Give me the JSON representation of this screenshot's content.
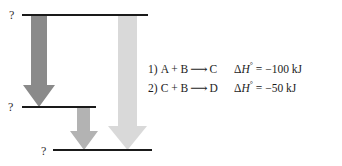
{
  "diagram": {
    "type": "energy-level-diagram",
    "title": "",
    "levels": [
      {
        "id": "top",
        "label": "?",
        "x1": 22,
        "x2": 148,
        "y": 15
      },
      {
        "id": "middle",
        "label": "?",
        "x1": 22,
        "x2": 96,
        "y": 107
      },
      {
        "id": "bottom",
        "label": "?",
        "x1": 53,
        "x2": 152,
        "y": 150
      }
    ],
    "level_line_color": "#1a1a1a",
    "arrows": [
      {
        "id": "arrow-1",
        "from_level": "top",
        "to_level": "middle",
        "color": "#8a8a8a",
        "shaft_x1": 31,
        "shaft_x2": 47,
        "head_x1": 23,
        "head_x2": 55,
        "y_start": 15,
        "y_tip": 107,
        "head_height": 22
      },
      {
        "id": "arrow-2",
        "from_level": "middle",
        "to_level": "bottom",
        "color": "#b3b3b3",
        "shaft_x1": 77,
        "shaft_x2": 90,
        "head_x1": 70,
        "head_x2": 98,
        "y_start": 107,
        "y_tip": 150,
        "head_height": 19
      },
      {
        "id": "arrow-3",
        "from_level": "top",
        "to_level": "bottom",
        "color": "#d9d9d9",
        "shaft_x1": 118,
        "shaft_x2": 137,
        "head_x1": 108,
        "head_x2": 147,
        "y_start": 15,
        "y_tip": 150,
        "head_height": 24
      }
    ]
  },
  "equations": [
    {
      "index": "1)",
      "reactants": "A + B",
      "arrow": "⟶",
      "product": "C",
      "delta_symbol": "Δ",
      "h_symbol": "H",
      "degree_symbol": "°",
      "equals": "=",
      "value": "−100 kJ",
      "enthalpy_full": "ΔH° = −100 kJ"
    },
    {
      "index": "2)",
      "reactants": "C + B",
      "arrow": "⟶",
      "product": "D",
      "delta_symbol": "Δ",
      "h_symbol": "H",
      "degree_symbol": "°",
      "equals": "=",
      "value": "−50 kJ",
      "enthalpy_full": "ΔH° = −50 kJ"
    }
  ],
  "colors": {
    "background": "#ffffff",
    "text": "#1c1c1c",
    "line": "#1a1a1a",
    "arrow_dark": "#8a8a8a",
    "arrow_medium": "#b3b3b3",
    "arrow_light": "#d9d9d9"
  }
}
